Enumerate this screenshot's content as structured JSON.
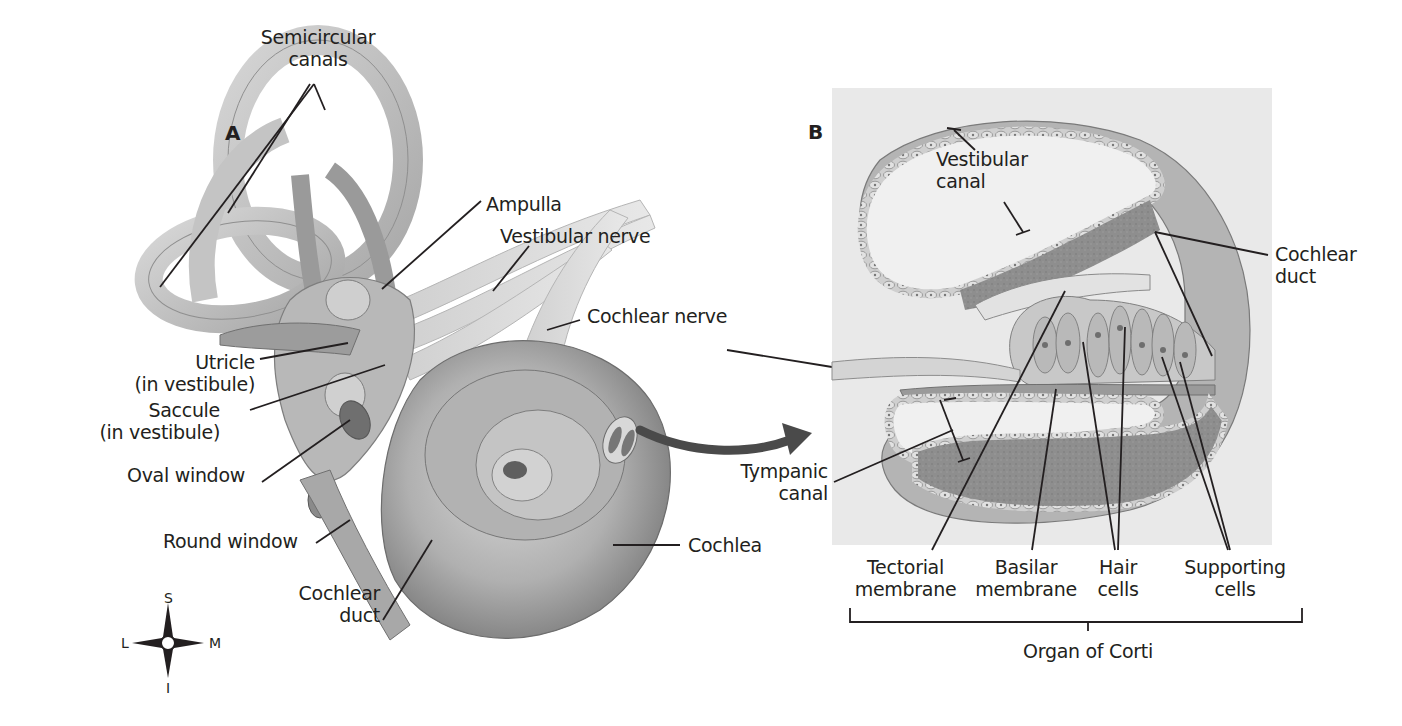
{
  "figure": {
    "panels": [
      {
        "id": "A",
        "letter": "A",
        "subject": "Inner ear (bony/membranous labyrinth)"
      },
      {
        "id": "B",
        "letter": "B",
        "subject": "Cross-section of cochlea"
      }
    ]
  },
  "panel_a": {
    "letter": "A",
    "labels": {
      "semicircular_canals_1": "Semicircular",
      "semicircular_canals_2": "canals",
      "ampulla": "Ampulla",
      "vestibular_nerve": "Vestibular nerve",
      "cochlear_nerve": "Cochlear nerve",
      "utricle_1": "Utricle",
      "utricle_2": "(in vestibule)",
      "saccule_1": "Saccule",
      "saccule_2": "(in vestibule)",
      "oval_window": "Oval window",
      "round_window": "Round window",
      "cochlear_duct_1": "Cochlear",
      "cochlear_duct_2": "duct",
      "cochlea": "Cochlea"
    },
    "compass": {
      "superior": "S",
      "inferior": "I",
      "lateral": "L",
      "medial": "M"
    }
  },
  "panel_b": {
    "letter": "B",
    "labels": {
      "vestibular_canal_1": "Vestibular",
      "vestibular_canal_2": "canal",
      "cochlear_duct_1": "Cochlear",
      "cochlear_duct_2": "duct",
      "tympanic_canal_1": "Tympanic",
      "tympanic_canal_2": "canal",
      "tectorial_1": "Tectorial",
      "tectorial_2": "membrane",
      "basilar_1": "Basilar",
      "basilar_2": "membrane",
      "hair_1": "Hair",
      "hair_2": "cells",
      "supporting_1": "Supporting",
      "supporting_2": "cells",
      "organ_of_corti": "Organ of Corti"
    }
  },
  "colors": {
    "background": "#ffffff",
    "panel_b_bg": "#e9e9e9",
    "tissue_light": "#c9c9c9",
    "tissue_mid": "#a4a4a4",
    "tissue_dark": "#6f6f6f",
    "leader_line": "#231f20",
    "arrow": "#4a4a4a"
  }
}
